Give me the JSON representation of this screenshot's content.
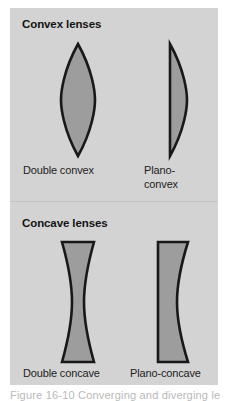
{
  "figure": {
    "panel_background": "#d3d3d3",
    "lens_fill": "#9d9d9d",
    "lens_outline": "#181818",
    "page_background": "#ffffff",
    "sections": [
      {
        "heading": "Convex lenses",
        "lenses": [
          {
            "name": "double-convex",
            "caption": "Double convex"
          },
          {
            "name": "plano-convex",
            "caption": "Plano-convex"
          }
        ]
      },
      {
        "heading": "Concave lenses",
        "lenses": [
          {
            "name": "double-concave",
            "caption": "Double concave"
          },
          {
            "name": "plano-concave",
            "caption": "Plano-concave"
          }
        ]
      }
    ],
    "bottom_caption": "Figure 16-10 Converging and diverging lenses"
  }
}
